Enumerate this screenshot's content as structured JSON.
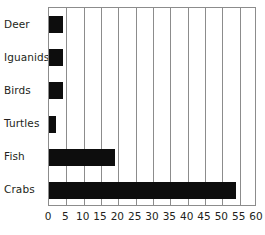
{
  "chart_data": {
    "type": "bar",
    "orientation": "horizontal",
    "title": "",
    "subtitle": "",
    "xlabel": "",
    "ylabel": "",
    "categories": [
      "Deer",
      "Iguanids",
      "Birds",
      "Turtles",
      "Fish",
      "Crabs"
    ],
    "values": [
      4,
      4,
      4,
      2,
      19,
      54
    ],
    "xlim": [
      0,
      60
    ],
    "xticks": [
      0,
      5,
      10,
      15,
      20,
      25,
      30,
      35,
      40,
      45,
      50,
      55,
      60
    ],
    "xtick_labels": [
      "0",
      "5",
      "10",
      "15",
      "20",
      "25",
      "30",
      "35",
      "40",
      "45",
      "50",
      "55",
      "60"
    ],
    "grid": {
      "vertical": true,
      "horizontal": false
    },
    "legend": {
      "visible": false,
      "position": "none",
      "entries": []
    },
    "annotations": [],
    "colors": {
      "bar": "#0d0d0d",
      "gridline": "#8c8c8c",
      "axis": "#8c8c8c",
      "text": "#231f20",
      "background": "#ffffff"
    }
  }
}
